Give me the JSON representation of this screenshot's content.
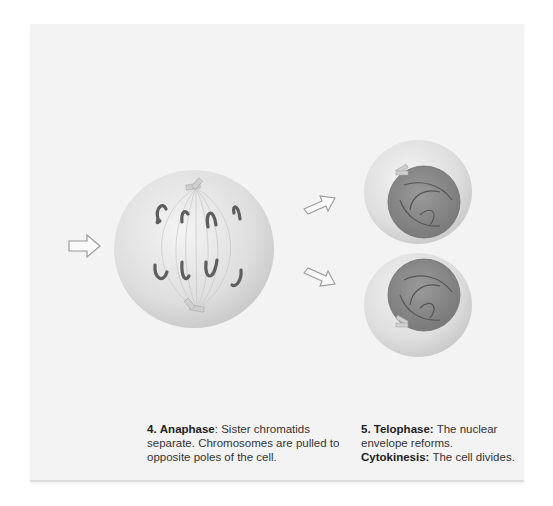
{
  "figure": {
    "type": "mitosis-stages-diagram",
    "panels": [
      {
        "id": "anaphase",
        "number": "4.",
        "title": "Anaphase",
        "title_suffix": ":",
        "description": "Sister chromatids separate. Chromosomes are pulled to opposite poles of the cell."
      },
      {
        "id": "telophase",
        "number": "5.",
        "title": "Telophase:",
        "description": "The nuclear envelope reforms.",
        "extra_title": "Cytokinesis:",
        "extra_description": "The cell divides."
      }
    ],
    "arrows": [
      "incoming-arrow",
      "arrow-to-top-daughter",
      "arrow-to-bottom-daughter"
    ],
    "colors": {
      "panel_bg": "#f3f3f3",
      "cell": "#dcdcdc",
      "chromosome": "#6a6a6a",
      "nucleus": "#8a8a8a",
      "centrosome": "#c8c8c8"
    }
  }
}
